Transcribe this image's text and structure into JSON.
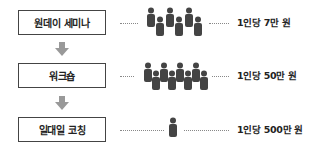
{
  "diagram": {
    "title": "",
    "rows": [
      {
        "label": "원데이 세미나",
        "price": "1인당 7만 원",
        "people_count": 6
      },
      {
        "label": "워크숍",
        "price": "1인당 50만 원",
        "people_count": 8
      },
      {
        "label": "일대일 코칭",
        "price": "1인당 500만 원",
        "people_count": 1
      }
    ],
    "icons": {
      "arrow": "down-arrow-icon",
      "person": "person-icon"
    },
    "colors": {
      "box_border": "#444444",
      "arrow": "#999999",
      "person": "#444444",
      "dots": "#888888",
      "text": "#222222"
    }
  }
}
